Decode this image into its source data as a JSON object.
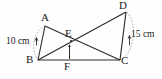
{
  "figure": {
    "stroke_color": "#2b2b2b",
    "arc_color": "#9a9a9a",
    "background": "#fefefe"
  },
  "vertices": [
    {
      "id": "A",
      "label": "A",
      "x": 45,
      "y": 26,
      "label_x": 41,
      "label_y": 13
    },
    {
      "id": "B",
      "label": "B",
      "x": 38,
      "y": 60,
      "label_x": 26,
      "label_y": 55
    },
    {
      "id": "C",
      "label": "C",
      "x": 120,
      "y": 60,
      "label_x": 121,
      "label_y": 56
    },
    {
      "id": "D",
      "label": "D",
      "x": 126,
      "y": 12,
      "label_x": 119,
      "label_y": 0
    },
    {
      "id": "E",
      "label": "E",
      "x": 71,
      "y": 41,
      "label_x": 65,
      "label_y": 28
    },
    {
      "id": "F",
      "label": "F",
      "x": 69,
      "y": 60,
      "label_x": 64,
      "label_y": 61
    }
  ],
  "segments": [
    {
      "name": "segment-AB",
      "from": "A",
      "to": "B"
    },
    {
      "name": "segment-AC",
      "from": "A",
      "to": "C"
    },
    {
      "name": "segment-BD",
      "from": "B",
      "to": "D"
    },
    {
      "name": "segment-BC",
      "from": "B",
      "to": "C"
    },
    {
      "name": "segment-DC",
      "from": "D",
      "to": "C"
    },
    {
      "name": "segment-EF",
      "from": "E",
      "to": "F"
    }
  ],
  "arcs": [
    {
      "name": "arc-AB",
      "from": "A",
      "to": "B",
      "side": "left",
      "measure": "10 cm"
    },
    {
      "name": "arc-DC",
      "from": "D",
      "to": "C",
      "side": "right",
      "measure": "15 cm"
    }
  ],
  "dimensions": {
    "left": {
      "text": "10 cm",
      "x": 6,
      "y": 37
    },
    "right": {
      "text": "15 cm",
      "x": 127,
      "y": 30
    }
  }
}
